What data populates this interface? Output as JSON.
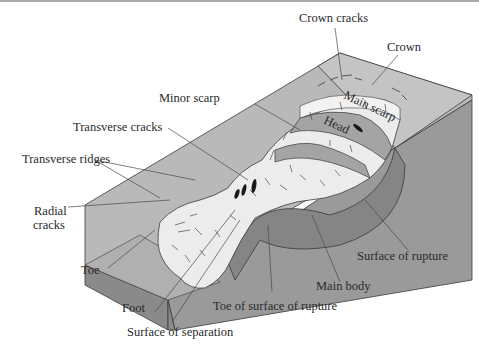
{
  "figure": {
    "colors": {
      "top_surface": "#b9b9b9",
      "side_face": "#8f8f8f",
      "right_face": "#9a9a9a",
      "front_face": "#8a8a8a",
      "displaced_material": "#ececec",
      "rupture_surface": "#858585",
      "head_block": "#a4a4a4",
      "outline": "#3a3a3a",
      "leader_line": "#4a4a4a",
      "text": "#2a2a2a"
    },
    "labels": {
      "crown_cracks": "Crown cracks",
      "crown": "Crown",
      "main_scarp": "Main scarp",
      "minor_scarp": "Minor scarp",
      "head": "Head",
      "transverse_cracks": "Transverse cracks",
      "transverse_ridges": "Transverse ridges",
      "radial_cracks_line1": "Radial",
      "radial_cracks_line2": "cracks",
      "toe": "Toe",
      "foot": "Foot",
      "surface_of_separation": "Surface of separation",
      "toe_of_surface_of_rupture": "Toe of surface of rupture",
      "main_body": "Main body",
      "surface_of_rupture": "Surface of rupture"
    }
  }
}
